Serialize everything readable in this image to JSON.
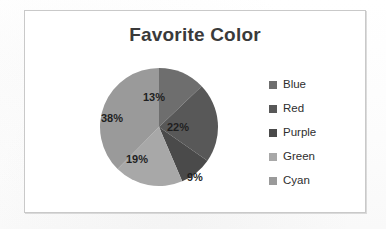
{
  "chart_data": {
    "type": "pie",
    "title": "Favorite Color",
    "xlabel": "",
    "ylabel": "",
    "legend_position": "right",
    "grid": false,
    "start_angle_deg": 0,
    "direction": "clockwise",
    "categories": [
      "Blue",
      "Red",
      "Purple",
      "Green",
      "Cyan"
    ],
    "values": [
      13,
      22,
      9,
      19,
      38
    ],
    "value_labels": [
      "13%",
      "22%",
      "9%",
      "19%",
      "38%"
    ],
    "slice_colors": [
      "#6e6e6e",
      "#585858",
      "#4a4a4a",
      "#a8a8a8",
      "#9a9a9a"
    ],
    "legend_swatch_colors": [
      "#6e6e6e",
      "#585858",
      "#4a4a4a",
      "#a8a8a8",
      "#9a9a9a"
    ]
  },
  "chart": {
    "title": "Favorite Color",
    "labels": {
      "blue": "13%",
      "red": "22%",
      "purple": "9%",
      "green": "19%",
      "cyan": "38%"
    },
    "legend": {
      "items": [
        {
          "label": "Blue",
          "swatch": "#6e6e6e"
        },
        {
          "label": "Red",
          "swatch": "#585858"
        },
        {
          "label": "Purple",
          "swatch": "#4a4a4a"
        },
        {
          "label": "Green",
          "swatch": "#a8a8a8"
        },
        {
          "label": "Cyan",
          "swatch": "#9a9a9a"
        }
      ]
    }
  },
  "theme": {
    "title_color": "#3a3a3a",
    "frame_border": "#c9c9c9",
    "page_background": "#fdfdfd",
    "label_color": "#1f1f1f"
  }
}
